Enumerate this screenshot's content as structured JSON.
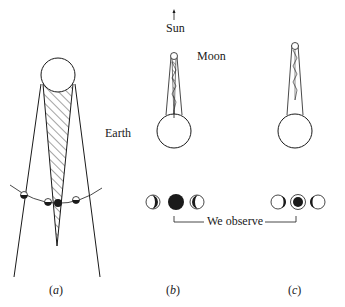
{
  "labels": {
    "sun": "Sun",
    "moon": "Moon",
    "earth": "Earth",
    "we_observe": "We observe"
  },
  "panels": [
    {
      "id": "a",
      "caption_open": "(",
      "caption_letter": "a",
      "caption_close": ")"
    },
    {
      "id": "b",
      "caption_open": "(",
      "caption_letter": "b",
      "caption_close": ")"
    },
    {
      "id": "c",
      "caption_open": "(",
      "caption_letter": "c",
      "caption_close": ")"
    }
  ],
  "observed_phases": {
    "b": [
      "crescent-left",
      "full-dark",
      "crescent-right"
    ],
    "c": [
      "crescent-right-small",
      "dark-with-ring",
      "crescent-left-small"
    ]
  },
  "colors": {
    "stroke": "#1a1a1a",
    "background": "#ffffff"
  }
}
